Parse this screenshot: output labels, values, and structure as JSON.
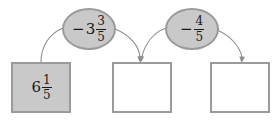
{
  "diagram": {
    "type": "flow-chart-arithmetic",
    "colors": {
      "box_border": "#9a9a9a",
      "box_fill_active": "#c9c9c9",
      "box_fill_empty": "#ffffff",
      "oval_border": "#9a9a9a",
      "oval_fill": "#c9c9c9",
      "arrow": "#8d8d8d",
      "text": "#1a1a1a"
    },
    "boxes": [
      {
        "id": "box-1",
        "state": "filled",
        "sign": "",
        "whole": "6",
        "numerator": "1",
        "denominator": "5",
        "value_text": "6 1/5",
        "empty": false
      },
      {
        "id": "box-2",
        "state": "empty",
        "sign": "",
        "whole": "",
        "numerator": "",
        "denominator": "",
        "value_text": "",
        "empty": true
      },
      {
        "id": "box-3",
        "state": "empty",
        "sign": "",
        "whole": "",
        "numerator": "",
        "denominator": "",
        "value_text": "",
        "empty": true
      }
    ],
    "operations": [
      {
        "id": "oval-1",
        "sign": "−",
        "whole": "3",
        "numerator": "3",
        "denominator": "5",
        "value_text": "-3 3/5"
      },
      {
        "id": "oval-2",
        "sign": "−",
        "whole": "",
        "numerator": "4",
        "denominator": "5",
        "value_text": "-4/5"
      }
    ],
    "arrows": [
      {
        "id": "arrow-1",
        "from": "box-1",
        "to": "oval-1",
        "direction": "up-right"
      },
      {
        "id": "arrow-2",
        "from": "oval-1",
        "to": "box-2",
        "direction": "down-right"
      },
      {
        "id": "arrow-3",
        "from": "box-2",
        "to": "oval-2",
        "direction": "up-right"
      },
      {
        "id": "arrow-4",
        "from": "oval-2",
        "to": "box-3",
        "direction": "down-right"
      }
    ]
  }
}
